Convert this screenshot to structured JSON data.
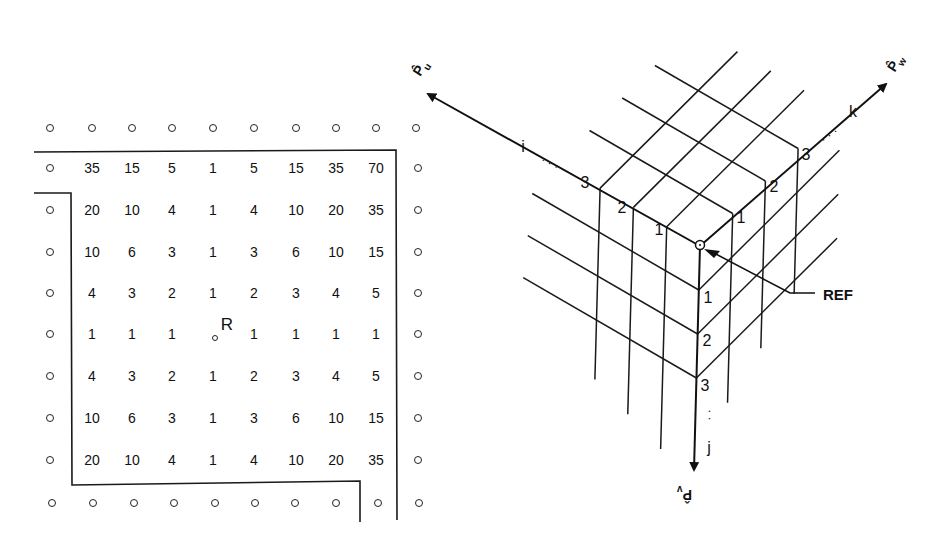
{
  "left_panel": {
    "title": "",
    "reference_marker": "R",
    "boundary_marker": "o",
    "grid_rows": [
      [
        "35",
        "15",
        "5",
        "1",
        "5",
        "15",
        "35",
        "70"
      ],
      [
        "20",
        "10",
        "4",
        "1",
        "4",
        "10",
        "20",
        "35"
      ],
      [
        "10",
        "6",
        "3",
        "1",
        "3",
        "6",
        "10",
        "15"
      ],
      [
        "4",
        "3",
        "2",
        "1",
        "2",
        "3",
        "4",
        "5"
      ],
      [
        "1",
        "1",
        "1",
        "",
        "1",
        "1",
        "1",
        "1"
      ],
      [
        "4",
        "3",
        "2",
        "1",
        "2",
        "3",
        "4",
        "5"
      ],
      [
        "10",
        "6",
        "3",
        "1",
        "3",
        "6",
        "10",
        "15"
      ],
      [
        "20",
        "10",
        "4",
        "1",
        "4",
        "10",
        "20",
        "35"
      ]
    ],
    "reference_cell": {
      "row": 4,
      "col": 3
    }
  },
  "right_panel": {
    "reference_label": "REF",
    "axes": {
      "i": {
        "label": "i",
        "unit_vector": "P̂ᵤ",
        "ticks": [
          "1",
          "2",
          "3"
        ],
        "ellipsis": "· · ·"
      },
      "j": {
        "label": "j",
        "unit_vector": "P̂ᵥ",
        "ticks": [
          "1",
          "2",
          "3"
        ],
        "ellipsis": "· ·"
      },
      "k": {
        "label": "k",
        "unit_vector": "P̂ᵥ",
        "ticks": [
          "1",
          "2",
          "3"
        ],
        "ellipsis": "· · ·"
      }
    },
    "axis_symbol_i": "P̂",
    "axis_symbol_i_sub": "u",
    "axis_symbol_j": "P̂",
    "axis_symbol_j_sub": "v",
    "axis_symbol_k": "P̂",
    "axis_symbol_k_sub": "w"
  }
}
